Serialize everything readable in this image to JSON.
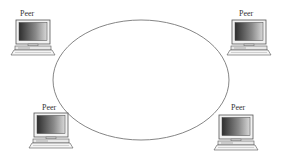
{
  "diagram": {
    "title": "",
    "type": "peer-to-peer network",
    "ring": {
      "shape": "ellipse",
      "stroke": "#777777"
    },
    "peers": [
      {
        "id": "peer-top-left",
        "label": "Peer",
        "icon": "desktop-computer-icon"
      },
      {
        "id": "peer-top-right",
        "label": "Peer",
        "icon": "desktop-computer-icon"
      },
      {
        "id": "peer-bottom-left",
        "label": "Peer",
        "icon": "desktop-computer-icon"
      },
      {
        "id": "peer-bottom-right",
        "label": "Peer",
        "icon": "desktop-computer-icon"
      }
    ],
    "colors": {
      "screen_dark": "#3a3a3a",
      "screen_light": "#cfcfcf",
      "outline": "#555555",
      "ring": "#777777"
    }
  }
}
